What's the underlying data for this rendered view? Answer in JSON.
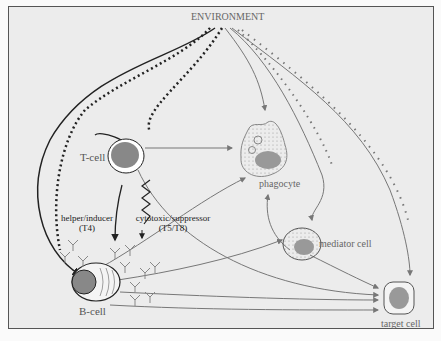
{
  "title": "ENVIRONMENT",
  "cells": {
    "t_cell": "T-cell",
    "b_cell": "B-cell",
    "phagocyte": "phagocyte",
    "mediator_cell": "mediator cell",
    "target_cell": "target cell"
  },
  "subsets": {
    "helper_line1": "helper/inducer",
    "helper_line2": "(T4)",
    "cytotoxic_line1": "cytotoxic/suppressor",
    "cytotoxic_line2": "(T5/T8)"
  },
  "colors": {
    "background": "#ececec",
    "frame": "#555555",
    "dark_path": "#222222",
    "grey_path": "#777777",
    "cell_fill": "#888888"
  }
}
